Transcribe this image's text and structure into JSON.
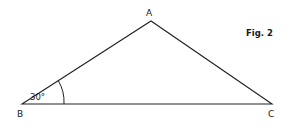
{
  "figure": {
    "caption": "Fig. 2",
    "vertices": {
      "A": {
        "label": "A",
        "x": 151,
        "y": 21
      },
      "B": {
        "label": "B",
        "x": 22,
        "y": 104
      },
      "C": {
        "label": "C",
        "x": 272,
        "y": 104
      }
    },
    "angle": {
      "vertex": "B",
      "label": "30°"
    },
    "stroke_color": "#222222"
  }
}
